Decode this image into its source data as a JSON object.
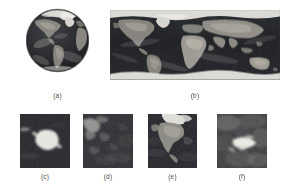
{
  "figure": {
    "background_color": "#ffffff",
    "panel_count": 6
  },
  "palette": {
    "ocean_dark": "#1d1f22",
    "ocean_mid": "#2a2d31",
    "land_gray": "#8d8b84",
    "land_light": "#b6b2a8",
    "ice_white": "#ecebe6",
    "cloud_gray": "#6e6f6c",
    "caption_text": "#4a4a4a",
    "space_background": "#ffffff"
  },
  "panels": [
    {
      "id": "a",
      "caption": "(a)",
      "name": "globe-orthographic",
      "description": "Orthographic globe view of Earth centered on the Americas with Arctic ice at top",
      "shape": "circle",
      "features": [
        "north-america",
        "south-america",
        "greenland-ice",
        "atlantic-ocean",
        "africa-edge"
      ]
    },
    {
      "id": "b",
      "caption": "(b)",
      "name": "world-map-equirectangular",
      "description": "Full equirectangular world map with polar ice caps at top and bottom",
      "shape": "rectangle",
      "features": [
        "north-america",
        "south-america",
        "africa",
        "eurasia",
        "australia",
        "antarctica-ice",
        "arctic-ice"
      ]
    },
    {
      "id": "c",
      "caption": "(c)",
      "name": "inset-antarctica",
      "description": "Close-up of Antarctica, bright white ice mass on dark ocean",
      "shape": "rectangle",
      "features": [
        "antarctica-ice",
        "southern-ocean"
      ]
    },
    {
      "id": "d",
      "caption": "(d)",
      "name": "inset-ocean-clouds",
      "description": "Close-up of dark ocean region with bright cloud streaks in upper left",
      "shape": "rectangle",
      "features": [
        "cloud-bands",
        "open-ocean"
      ]
    },
    {
      "id": "e",
      "caption": "(e)",
      "name": "inset-north-america",
      "description": "Close-up of North America with bright Arctic snow and ice at top",
      "shape": "rectangle",
      "features": [
        "north-america",
        "arctic-ice",
        "pacific-ocean",
        "atlantic-ocean"
      ]
    },
    {
      "id": "f",
      "caption": "(f)",
      "name": "inset-landmass-bright",
      "description": "Close-up of a bright snow-covered landmass surrounded by mottled gray terrain and cloud",
      "shape": "rectangle",
      "features": [
        "snow-covered-land",
        "cloud-cover",
        "terrain"
      ]
    }
  ],
  "captions": {
    "a": "(a)",
    "b": "(b)",
    "c": "(c)",
    "d": "(d)",
    "e": "(e)",
    "f": "(f)"
  }
}
